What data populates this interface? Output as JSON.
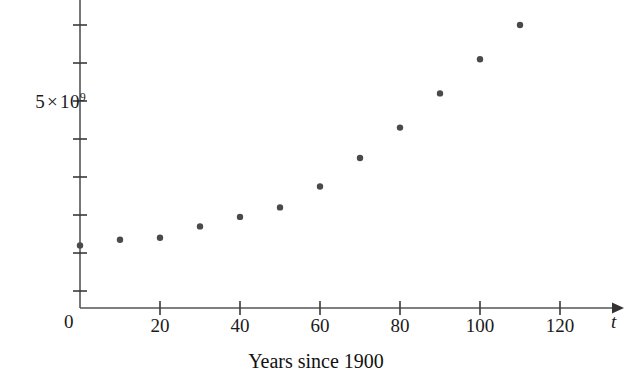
{
  "figure": {
    "caption": "Years since 1900",
    "x_axis_variable": "t",
    "origin_label": "0",
    "y_axis_label_mantissa": "5",
    "y_axis_label_times": "×",
    "y_axis_label_base": "10",
    "y_axis_label_exponent": "9",
    "point_color": "#4a4a4a",
    "axis_color": "#555555"
  },
  "chart_data": {
    "type": "scatter",
    "title": "",
    "xlabel": "Years since 1900",
    "ylabel": "",
    "x": [
      0,
      10,
      20,
      30,
      40,
      50,
      60,
      70,
      80,
      90,
      100,
      110
    ],
    "values": [
      1200000000.0,
      1350000000.0,
      1400000000.0,
      1700000000.0,
      1950000000.0,
      2200000000.0,
      2750000000.0,
      3500000000.0,
      4300000000.0,
      5200000000.0,
      6100000000.0,
      7000000000.0
    ],
    "xlim": [
      0,
      130
    ],
    "ylim": [
      0,
      7600000000.0
    ],
    "xticks": [
      0,
      20,
      40,
      60,
      80,
      100,
      120
    ],
    "xtick_labels": [
      "0",
      "20",
      "40",
      "60",
      "80",
      "100",
      "120"
    ],
    "yticks": [
      5000000000
    ],
    "ytick_labels": [
      "5 × 10⁹"
    ],
    "y_minor_ticks": [
      1000000000,
      2000000000,
      3000000000,
      4000000000,
      6000000000,
      7000000000
    ],
    "grid": false,
    "legend": null,
    "axis_arrow_x": true
  },
  "xticks": [
    {
      "label": "0",
      "value": 0
    },
    {
      "label": "20",
      "value": 20
    },
    {
      "label": "40",
      "value": 40
    },
    {
      "label": "60",
      "value": 60
    },
    {
      "label": "80",
      "value": 80
    },
    {
      "label": "100",
      "value": 100
    },
    {
      "label": "120",
      "value": 120
    }
  ]
}
